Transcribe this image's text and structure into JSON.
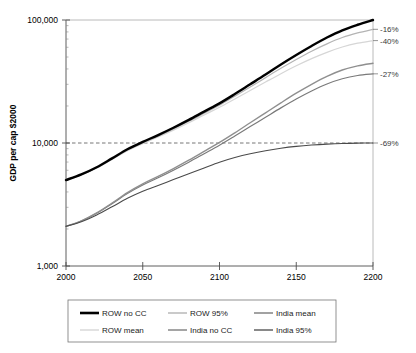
{
  "chart_data": {
    "type": "line",
    "title": "",
    "xlabel": "",
    "ylabel": "GDP per cap $2000",
    "xlim": [
      2000,
      2200
    ],
    "ylim": [
      1000,
      100000
    ],
    "yscale": "log",
    "grid": false,
    "legend_position": "bottom",
    "x_ticks": [
      "2000",
      "2050",
      "2100",
      "2150",
      "2200"
    ],
    "x_tick_values": [
      2000,
      2050,
      2100,
      2150,
      2200
    ],
    "y_ticks": [
      "100,000",
      "10,000",
      "1,000"
    ],
    "y_tick_values": [
      100000,
      10000,
      1000
    ],
    "reference_line": {
      "y": 10000,
      "style": "dashed",
      "color": "#666666"
    },
    "x": [
      2000,
      2010,
      2020,
      2030,
      2040,
      2050,
      2060,
      2070,
      2080,
      2090,
      2100,
      2110,
      2120,
      2130,
      2140,
      2150,
      2160,
      2170,
      2180,
      2190,
      2200
    ],
    "series": [
      {
        "name": "ROW no CC",
        "color": "#000000",
        "width": 2.4,
        "values": [
          5000,
          5550,
          6350,
          7500,
          8900,
          10200,
          11600,
          13300,
          15400,
          18000,
          21000,
          25000,
          30000,
          36000,
          43500,
          52000,
          61500,
          72000,
          82500,
          91500,
          100000
        ]
      },
      {
        "name": "ROW 95%",
        "color": "#b4b4b4",
        "width": 1.2,
        "values": [
          5000,
          5530,
          6300,
          7420,
          8780,
          10030,
          11380,
          13000,
          15000,
          17450,
          20300,
          24000,
          28500,
          34000,
          40500,
          47800,
          55800,
          64000,
          72000,
          78500,
          84000
        ]
      },
      {
        "name": "ROW mean",
        "color": "#d6d6d6",
        "width": 1.2,
        "values": [
          5000,
          5510,
          6260,
          7350,
          8670,
          9880,
          11180,
          12720,
          14600,
          16900,
          19500,
          22800,
          26700,
          31300,
          36600,
          42400,
          48500,
          54600,
          60300,
          64800,
          68000
        ]
      },
      {
        "name": "India no CC",
        "color": "#8f8f8f",
        "width": 1.4,
        "values": [
          2100,
          2330,
          2700,
          3250,
          3950,
          4650,
          5350,
          6200,
          7250,
          8550,
          10100,
          12100,
          14600,
          17600,
          21200,
          25400,
          30000,
          34800,
          39200,
          42400,
          44500
        ]
      },
      {
        "name": "India mean",
        "color": "#7a7a7a",
        "width": 1.2,
        "values": [
          2100,
          2320,
          2680,
          3210,
          3880,
          4550,
          5210,
          6010,
          6980,
          8180,
          9600,
          11400,
          13600,
          16200,
          19300,
          22800,
          26500,
          30200,
          33300,
          35400,
          36500
        ]
      },
      {
        "name": "India 95%",
        "color": "#4a4a4a",
        "width": 1.1,
        "values": [
          2100,
          2290,
          2600,
          3030,
          3550,
          4050,
          4520,
          5040,
          5620,
          6270,
          6980,
          7620,
          8180,
          8660,
          9060,
          9380,
          9620,
          9800,
          9920,
          9980,
          10000
        ]
      }
    ],
    "annotations": [
      {
        "label": "-16%",
        "value": 84000,
        "series": "ROW 95%"
      },
      {
        "label": "-40%",
        "value": 68000,
        "series": "ROW mean"
      },
      {
        "label": "-27%",
        "value": 36500,
        "series": "India mean"
      },
      {
        "label": "-69%",
        "value": 10000,
        "series": "India 95%"
      }
    ],
    "legend": [
      {
        "label": "ROW no CC",
        "color": "#000000",
        "width": 2.6
      },
      {
        "label": "ROW 95%",
        "color": "#b4b4b4",
        "width": 1.4
      },
      {
        "label": "India mean",
        "color": "#7a7a7a",
        "width": 1.4
      },
      {
        "label": "ROW mean",
        "color": "#d6d6d6",
        "width": 1.4
      },
      {
        "label": "India no CC",
        "color": "#8f8f8f",
        "width": 1.6
      },
      {
        "label": "India 95%",
        "color": "#4a4a4a",
        "width": 1.3
      }
    ]
  }
}
